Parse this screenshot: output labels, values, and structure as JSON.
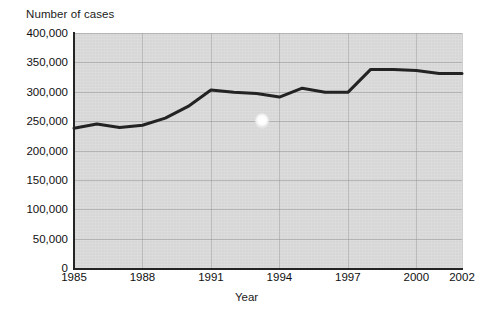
{
  "chart_data": {
    "type": "line",
    "title": "Number of cases",
    "xlabel": "Year",
    "ylabel": "",
    "xlim": [
      1985,
      2002
    ],
    "ylim": [
      0,
      400000
    ],
    "grid": true,
    "legend": null,
    "x_tick_labels": [
      "1985",
      "1988",
      "1991",
      "1994",
      "1997",
      "2000",
      "2002"
    ],
    "x_tick_values": [
      1985,
      1988,
      1991,
      1994,
      1997,
      2000,
      2002
    ],
    "y_tick_labels": [
      "0",
      "50,000",
      "100,000",
      "150,000",
      "200,000",
      "250,000",
      "300,000",
      "350,000",
      "400,000"
    ],
    "y_tick_values": [
      0,
      50000,
      100000,
      150000,
      200000,
      250000,
      300000,
      350000,
      400000
    ],
    "x": [
      1985,
      1986,
      1987,
      1988,
      1989,
      1990,
      1991,
      1992,
      1993,
      1994,
      1995,
      1996,
      1997,
      1998,
      1999,
      2000,
      2001,
      2002
    ],
    "values": [
      238000,
      245000,
      239000,
      243000,
      255000,
      275000,
      303000,
      299000,
      297000,
      291000,
      306000,
      299000,
      299000,
      338000,
      338000,
      336000,
      331000,
      331000
    ],
    "series": [
      {
        "name": "Number of cases",
        "color": "#232323",
        "values": [
          238000,
          245000,
          239000,
          243000,
          255000,
          275000,
          303000,
          299000,
          297000,
          291000,
          306000,
          299000,
          299000,
          338000,
          338000,
          336000,
          331000,
          331000
        ]
      }
    ],
    "colors": {
      "plot_background": "#d7d7d7",
      "line": "#232323",
      "axis": "#242424",
      "gridline": "#969696",
      "text": "#101010",
      "page_background": "#ffffff"
    },
    "annotations": [
      {
        "name": "scan-speck",
        "x": 1993.2,
        "y": 262000
      }
    ]
  }
}
